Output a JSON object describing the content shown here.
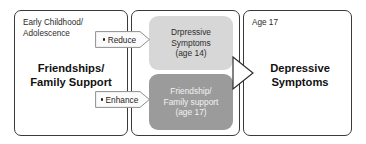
{
  "diagram": {
    "type": "flow-diagram",
    "panels": [
      {
        "id": "early-childhood",
        "stage_label": "Early Childhood/\nAdolescence",
        "main_text": "Friendships/\nFamily Support"
      },
      {
        "id": "mediators",
        "stage_label": "",
        "boxes": [
          {
            "id": "depressive-symptoms-14",
            "text": "Drpressive\nSymptoms\n(age 14)",
            "fill": "#d7d7d7",
            "text_color": "#2e2e2e"
          },
          {
            "id": "friendship-family-support-17",
            "text": "Friendship/\nFamily support\n(age 17)",
            "fill": "#9b9b9b",
            "text_color": "#f2f2f2"
          }
        ]
      },
      {
        "id": "outcome",
        "stage_label": "Age 17",
        "main_text": "Depressive\nSymptoms"
      }
    ],
    "arrows": [
      {
        "id": "reduce",
        "label": "Reduce",
        "bullet": true
      },
      {
        "id": "enhance",
        "label": "Enhance",
        "bullet": true
      },
      {
        "id": "to-outcome",
        "label": "",
        "shape": "hollow-triangle"
      }
    ],
    "colors": {
      "panel_border": "#3a3a3a",
      "background": "#ffffff",
      "arrow_outline": "#8f8f8f",
      "arrow_fill": "#fbfbfb",
      "light_box": "#d7d7d7",
      "dark_box": "#9b9b9b",
      "text_dark": "#111111"
    }
  }
}
